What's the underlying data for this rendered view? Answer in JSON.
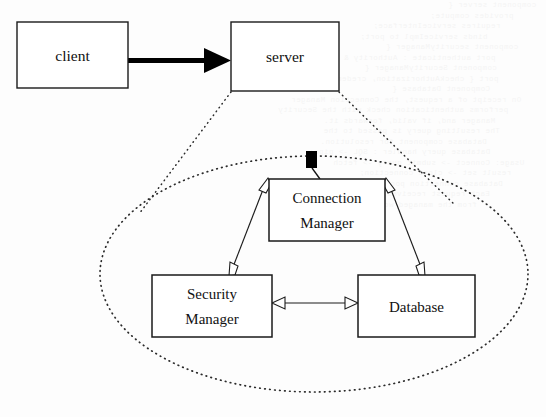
{
  "diagram": {
    "canvas": {
      "width": 546,
      "height": 417,
      "background": "#fdfdfd"
    },
    "colors": {
      "box_fill": "#ffffff",
      "box_stroke": "#1a1a1a",
      "text": "#111111",
      "flow_arrow": "#000000",
      "dotted": "#2b2b2b",
      "hollow_arrowhead_fill": "#ffffff"
    },
    "nodes": [
      {
        "id": "client",
        "label": "client",
        "lines": [
          "client"
        ],
        "x": 17,
        "y": 22,
        "w": 111,
        "h": 66,
        "layer": "outer"
      },
      {
        "id": "server",
        "label": "server",
        "lines": [
          "server"
        ],
        "x": 231,
        "y": 22,
        "w": 108,
        "h": 69,
        "layer": "outer"
      },
      {
        "id": "connection-manager",
        "label": "Connection Manager",
        "lines": [
          "Connection",
          "Manager"
        ],
        "x": 269,
        "y": 179,
        "w": 116,
        "h": 62,
        "layer": "inner"
      },
      {
        "id": "security-manager",
        "label": "Security Manager",
        "lines": [
          "Security",
          "Manager"
        ],
        "x": 152,
        "y": 275,
        "w": 120,
        "h": 62,
        "layer": "inner"
      },
      {
        "id": "database",
        "label": "Database",
        "lines": [
          "Database"
        ],
        "x": 358,
        "y": 275,
        "w": 117,
        "h": 62,
        "layer": "inner"
      }
    ],
    "edges": [
      {
        "id": "client-to-server",
        "from": "client",
        "to": "server",
        "style": "thick-solid",
        "arrowheads": "filled-single-end",
        "label": ""
      },
      {
        "id": "connection-manager-to-security-manager",
        "from": "connection-manager",
        "to": "security-manager",
        "style": "thin-solid",
        "arrowheads": "hollow-both-ends",
        "label": ""
      },
      {
        "id": "connection-manager-to-database",
        "from": "connection-manager",
        "to": "database",
        "style": "thin-solid",
        "arrowheads": "hollow-both-ends",
        "label": ""
      },
      {
        "id": "security-manager-to-database",
        "from": "security-manager",
        "to": "database",
        "style": "thin-solid",
        "arrowheads": "hollow-both-ends",
        "label": ""
      }
    ],
    "zoom_region": {
      "id": "server-internals",
      "shape": "ellipse",
      "style": "dotted",
      "cx": 314,
      "cy": 274,
      "rx": 214,
      "ry": 118,
      "source_node": "server",
      "callout_lines": 2
    },
    "entry_marker": {
      "id": "server-entry-point",
      "shape": "filled-rectangle",
      "x": 306,
      "y": 151,
      "w": 11,
      "h": 17,
      "attaches_to": "connection-manager"
    }
  },
  "background_text": {
    "description": "faint show-through text from reverse side of scanned page",
    "lines": [
      "  component server {",
      "    provides compute;",
      "    requires serviceInterface;",
      "    binds serviceImpl to port;",
      "",
      "  component securityManager {",
      "    port authenticate : Authority & implicit & log;",
      "",
      "        component SecurityManager {",
      "     port { checkAuthorization, credential query } }",
      "",
      "           Component Database {",
      "  On receipt of a request, the Connection Manager",
      "  performs authentication check with the Security",
      "  Manager and, if valid, forwards it.",
      "        The resulting query is passed to the",
      "        Database component for resolution.",
      "",
      "  Database query handler : SQL -> pipe;",
      "  Usage: Connect -> submit query -> fetch",
      "  result set -> close connection;",
      "",
      "        Database connection pool size;",
      "        Each request receives its own thread",
      "        from the managed worker pool."
    ]
  }
}
